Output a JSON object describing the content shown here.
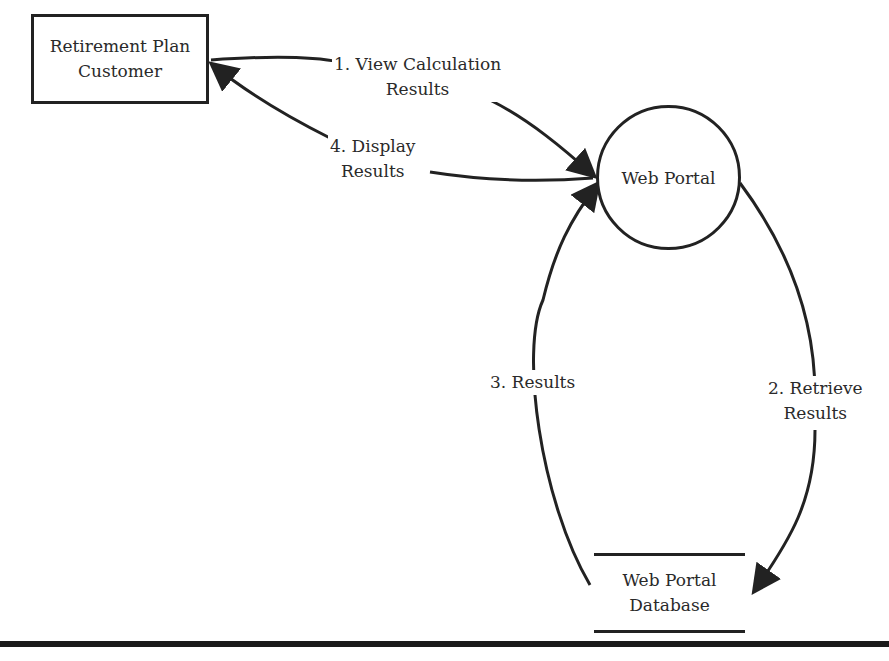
{
  "diagram": {
    "type": "data-flow-diagram",
    "entities": [
      {
        "id": "customer",
        "shape": "rectangle",
        "lines": [
          "Retirement Plan",
          "Customer"
        ]
      }
    ],
    "processes": [
      {
        "id": "portal",
        "shape": "circle",
        "label": "Web Portal"
      }
    ],
    "data_stores": [
      {
        "id": "db",
        "shape": "open-rectangle",
        "lines": [
          "Web Portal",
          "Database"
        ]
      }
    ],
    "flows": [
      {
        "from": "customer",
        "to": "portal",
        "lines": [
          "1. View Calculation",
          "Results"
        ]
      },
      {
        "from": "portal",
        "to": "db",
        "lines": [
          "2. Retrieve",
          "Results"
        ]
      },
      {
        "from": "db",
        "to": "portal",
        "lines": [
          "3. Results"
        ]
      },
      {
        "from": "portal",
        "to": "customer",
        "lines": [
          "4. Display",
          "Results"
        ]
      }
    ],
    "colors": {
      "stroke": "#222222",
      "background": "#ffffff"
    }
  }
}
